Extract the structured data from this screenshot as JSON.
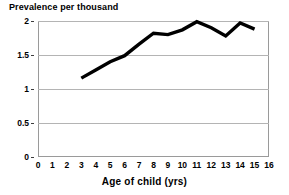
{
  "chart_data": {
    "type": "line",
    "title": "Prevalence per thousand",
    "xlabel": "Age of child (yrs)",
    "ylabel": "Prevalence per thousand",
    "xlim": [
      0,
      16
    ],
    "ylim": [
      0,
      2
    ],
    "grid": true,
    "legend": null,
    "series_color": "#000000",
    "grid_color": "#b4b4b4",
    "plot_border_color": "#9a9a9a",
    "x_ticks": [
      0,
      1,
      2,
      3,
      4,
      5,
      6,
      7,
      8,
      9,
      10,
      11,
      12,
      13,
      14,
      15,
      16
    ],
    "x_tick_labels": [
      "0",
      "1",
      "2",
      "3",
      "4",
      "5",
      "6",
      "7",
      "8",
      "9",
      "10",
      "11",
      "12",
      "13",
      "14",
      "15",
      "16"
    ],
    "y_ticks": [
      0,
      0.5,
      1,
      1.5,
      2
    ],
    "y_tick_labels": [
      "0",
      "0.5",
      "1",
      "1.5",
      "2"
    ],
    "series": [
      {
        "name": "Prevalence",
        "x": [
          3,
          4,
          5,
          6,
          7,
          8,
          9,
          10,
          11,
          12,
          13,
          14,
          15
        ],
        "values": [
          1.16,
          1.28,
          1.4,
          1.49,
          1.66,
          1.82,
          1.8,
          1.87,
          1.99,
          1.9,
          1.78,
          1.97,
          1.88
        ]
      }
    ]
  }
}
